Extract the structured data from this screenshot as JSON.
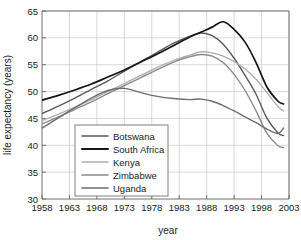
{
  "chart_data": {
    "type": "line",
    "title": "",
    "xlabel": "year",
    "ylabel": "life expectancy (years)",
    "xlim": [
      1958,
      2003
    ],
    "ylim": [
      30,
      65
    ],
    "grid": true,
    "legend_position": "lower-center-left",
    "xticks": [
      1958,
      1963,
      1968,
      1973,
      1978,
      1983,
      1988,
      1993,
      1998,
      2003
    ],
    "yticks": [
      30,
      35,
      40,
      45,
      50,
      55,
      60,
      65
    ],
    "x": [
      1958,
      1961,
      1964,
      1967,
      1970,
      1973,
      1976,
      1979,
      1982,
      1985,
      1987,
      1989,
      1991,
      1993,
      1995,
      1997,
      1999,
      2001,
      2002
    ],
    "series": [
      {
        "name": "Botswana",
        "color": "#5a5a5a",
        "values": [
          45.9,
          47.3,
          48.8,
          50.4,
          52.0,
          53.8,
          55.6,
          57.3,
          59.0,
          60.3,
          60.9,
          60.4,
          58.8,
          56.2,
          53.0,
          49.5,
          45.0,
          42.3,
          41.8
        ]
      },
      {
        "name": "South Africa",
        "color": "#151515",
        "values": [
          48.4,
          49.3,
          50.3,
          51.4,
          52.7,
          54.0,
          55.5,
          57.0,
          58.6,
          60.2,
          61.1,
          62.0,
          63.0,
          61.6,
          59.2,
          55.4,
          50.8,
          48.2,
          47.7
        ]
      },
      {
        "name": "Kenya",
        "color": "#b0b0b0",
        "values": [
          44.6,
          45.8,
          47.1,
          48.5,
          50.0,
          51.5,
          53.0,
          54.5,
          55.8,
          56.8,
          57.4,
          57.2,
          56.6,
          55.6,
          54.2,
          52.3,
          49.8,
          47.2,
          46.4
        ]
      },
      {
        "name": "Zimbabwe",
        "color": "#8a8a8a",
        "values": [
          44.0,
          45.3,
          46.7,
          48.1,
          49.6,
          51.1,
          52.6,
          54.1,
          55.5,
          56.5,
          56.9,
          56.6,
          55.4,
          53.2,
          50.2,
          46.4,
          42.2,
          39.9,
          39.6
        ]
      },
      {
        "name": "Uganda",
        "color": "#6e6e6e",
        "values": [
          43.2,
          45.1,
          47.0,
          48.8,
          50.2,
          50.6,
          49.8,
          49.1,
          48.7,
          48.5,
          48.6,
          48.2,
          47.4,
          46.4,
          45.3,
          44.2,
          43.0,
          42.2,
          43.2
        ]
      }
    ]
  },
  "legend": {
    "entries": [
      {
        "label": "Botswana"
      },
      {
        "label": "South Africa"
      },
      {
        "label": "Kenya"
      },
      {
        "label": "Zimbabwe"
      },
      {
        "label": "Uganda"
      }
    ]
  }
}
